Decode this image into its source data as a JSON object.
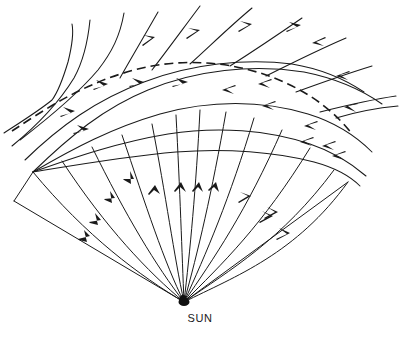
{
  "figure": {
    "title": "",
    "caption": "",
    "background_color": "#ffffff",
    "line_color": "#1a1a1a",
    "width": 400,
    "height": 339
  },
  "labels": {
    "sun": "SUN",
    "sun_position": {
      "x": 188,
      "y": 318
    }
  },
  "chart_data": {
    "type": "line",
    "title": "",
    "xlabel": "",
    "ylabel": "",
    "source_point": {
      "name": "SUN",
      "x": 184,
      "y": 302
    },
    "grid": false,
    "legend": null,
    "elements": [
      {
        "name": "shock-front",
        "style": "dashed",
        "role": "shock front arc"
      },
      {
        "name": "streamlines",
        "style": "solid",
        "role": "spiral field lines"
      },
      {
        "name": "radial-rays",
        "style": "solid",
        "role": "radial rays from Sun"
      },
      {
        "name": "outer-boundary",
        "style": "solid",
        "role": "outer sector boundary"
      }
    ],
    "shock_front_path": [
      [
        12,
        131
      ],
      [
        34,
        116
      ],
      [
        60,
        100
      ],
      [
        92,
        83
      ],
      [
        128,
        71
      ],
      [
        168,
        63
      ],
      [
        206,
        62
      ],
      [
        244,
        68
      ],
      [
        278,
        80
      ],
      [
        308,
        96
      ],
      [
        330,
        112
      ],
      [
        348,
        129
      ]
    ],
    "streamlines": [
      {
        "id": 1,
        "arrow_direction": "outward",
        "points": [
          [
            62,
            27
          ],
          [
            52,
            62
          ],
          [
            44,
            92
          ],
          [
            30,
            120
          ],
          [
            12,
            145
          ]
        ]
      },
      {
        "id": 2,
        "arrow_direction": "outward",
        "points": [
          [
            96,
            18
          ],
          [
            80,
            52
          ],
          [
            62,
            82
          ],
          [
            44,
            110
          ],
          [
            22,
            138
          ]
        ]
      },
      {
        "id": 3,
        "arrow_direction": "outward",
        "points": [
          [
            128,
            14
          ],
          [
            112,
            46
          ],
          [
            92,
            75
          ],
          [
            66,
            104
          ],
          [
            36,
            132
          ]
        ]
      },
      {
        "id": 4,
        "arrow_direction": "outward",
        "points": [
          [
            164,
            11
          ],
          [
            148,
            42
          ],
          [
            126,
            70
          ],
          [
            96,
            98
          ],
          [
            58,
            126
          ]
        ]
      },
      {
        "id": 5,
        "arrow_direction": "outward",
        "points": [
          [
            204,
            10
          ],
          [
            188,
            40
          ],
          [
            164,
            66
          ],
          [
            132,
            92
          ],
          [
            92,
            118
          ]
        ]
      },
      {
        "id": 6,
        "arrow_direction": "inward",
        "points": [
          [
            252,
            14
          ],
          [
            232,
            42
          ],
          [
            206,
            66
          ],
          [
            174,
            88
          ],
          [
            132,
            110
          ]
        ]
      },
      {
        "id": 7,
        "arrow_direction": "inward",
        "points": [
          [
            300,
            26
          ],
          [
            276,
            52
          ],
          [
            248,
            74
          ],
          [
            212,
            96
          ],
          [
            168,
            118
          ]
        ]
      },
      {
        "id": 8,
        "arrow_direction": "inward",
        "points": [
          [
            344,
            46
          ],
          [
            318,
            68
          ],
          [
            288,
            88
          ],
          [
            250,
            108
          ],
          [
            204,
            128
          ]
        ]
      },
      {
        "id": 9,
        "arrow_direction": "inward",
        "points": [
          [
            386,
            72
          ],
          [
            354,
            92
          ],
          [
            322,
            108
          ],
          [
            282,
            126
          ],
          [
            236,
            144
          ]
        ]
      }
    ],
    "radial_rays_count": 13,
    "arrow_direction_left_sector": "outward from Sun",
    "arrow_direction_center_sector": "inward toward Sun",
    "arrow_direction_right_sector": "outward from Sun"
  }
}
